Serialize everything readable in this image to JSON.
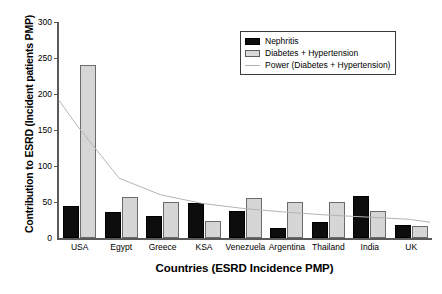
{
  "chart_data": {
    "type": "bar",
    "title": "",
    "xlabel": "Countries (ESRD Incidence PMP)",
    "ylabel": "Contribution to ESRD (Incident patients PMP)",
    "categories": [
      "USA",
      "Egypt",
      "Greece",
      "KSA",
      "Venezuela",
      "Argentina",
      "Thailand",
      "India",
      "UK"
    ],
    "series": [
      {
        "name": "Nephritis",
        "color": "#0d0d0d",
        "values": [
          44,
          36,
          30,
          48,
          38,
          14,
          22,
          58,
          18
        ]
      },
      {
        "name": "Diabetes + Hypertension",
        "color": "#d6d6d6",
        "values": [
          240,
          57,
          50,
          23,
          55,
          50,
          50,
          38,
          17
        ]
      },
      {
        "name": "Power (Diabetes + Hypertension)",
        "type": "line",
        "color": "#b5b5b5",
        "values": [
          155,
          83,
          60,
          48,
          41,
          36,
          32,
          29,
          26
        ]
      }
    ],
    "ylim": [
      0,
      300
    ],
    "yticks": [
      0,
      50,
      100,
      150,
      200,
      250,
      300
    ],
    "ytick_labels": [
      "0",
      "50",
      "100",
      "150",
      "200",
      "250",
      "300"
    ],
    "grid": false,
    "legend_position": "top-right"
  },
  "legend": {
    "items": [
      {
        "label": "Nephritis",
        "swatch": "nephritis-swatch"
      },
      {
        "label": "Diabetes + Hypertension",
        "swatch": "diabetes-hypertension-swatch"
      },
      {
        "label": "Power (Diabetes + Hypertension)",
        "swatch": "power-trend-swatch"
      }
    ]
  }
}
